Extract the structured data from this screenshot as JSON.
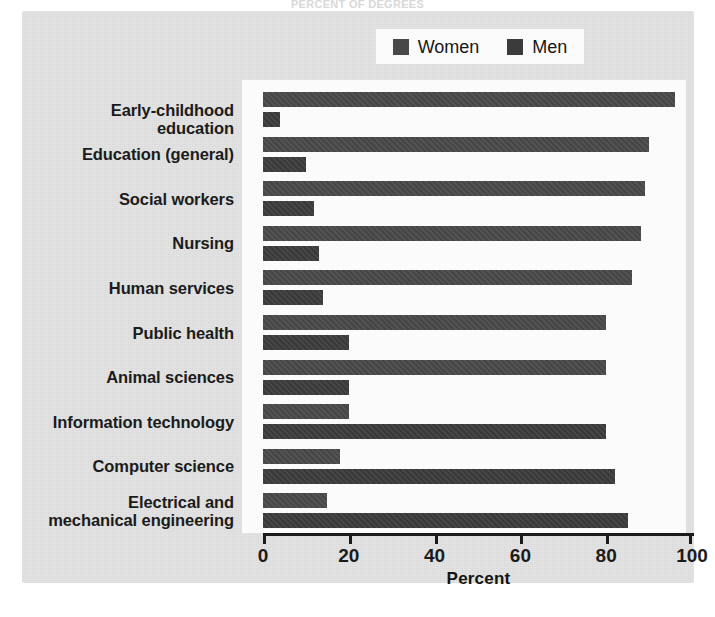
{
  "figure": {
    "ghost_title": "PERCENT OF DEGREES",
    "background_color": "#e3e3e3",
    "plot_background_color": "#fbfbfb"
  },
  "legend": {
    "position": "top-center",
    "entries": [
      {
        "label": "Women",
        "color": "#484848",
        "swatch_icon": "square-swatch-icon"
      },
      {
        "label": "Men",
        "color": "#3b3b3b",
        "swatch_icon": "square-swatch-icon"
      }
    ]
  },
  "axis": {
    "title": "Percent",
    "ticks": [
      "0",
      "20",
      "40",
      "60",
      "80",
      "100"
    ]
  },
  "chart_data": {
    "type": "bar",
    "orientation": "horizontal",
    "title": "",
    "subtitle": "",
    "xlabel": "Percent",
    "ylabel": "",
    "xlim": [
      0,
      100
    ],
    "xticks": [
      0,
      20,
      40,
      60,
      80,
      100
    ],
    "grid": false,
    "legend_position": "top-center",
    "categories": [
      "Early-childhood education",
      "Education (general)",
      "Social workers",
      "Nursing",
      "Human services",
      "Public health",
      "Animal sciences",
      "Information technology",
      "Computer science",
      "Electrical and mechanical engineering"
    ],
    "series": [
      {
        "name": "Women",
        "color": "#484848",
        "values": [
          96,
          90,
          89,
          88,
          86,
          80,
          80,
          20,
          18,
          15
        ]
      },
      {
        "name": "Men",
        "color": "#3b3b3b",
        "values": [
          4,
          10,
          12,
          13,
          14,
          20,
          20,
          80,
          82,
          85
        ]
      }
    ]
  }
}
